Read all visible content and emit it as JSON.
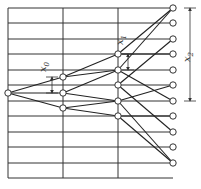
{
  "diagram": {
    "type": "tree-network",
    "colors": {
      "line": "#333333",
      "node_fill": "#ffffff",
      "background": "#ffffff"
    },
    "grid": {
      "left_x": 8,
      "right_x": 173,
      "vertical_lines_x": [
        8,
        63,
        118
      ],
      "horizontal_lines_y": [
        8,
        23,
        39,
        54,
        70,
        85,
        101,
        116,
        132,
        147,
        163,
        178
      ]
    },
    "stages": [
      {
        "name": "stage-0",
        "x": 8,
        "nodes_y": [
          93
        ]
      },
      {
        "name": "stage-1",
        "x": 63,
        "nodes_y": [
          77,
          93,
          108
        ]
      },
      {
        "name": "stage-2",
        "x": 118,
        "nodes_y": [
          54,
          70,
          85,
          101,
          116
        ]
      },
      {
        "name": "stage-3",
        "x": 173,
        "nodes_y": [
          8,
          23,
          39,
          54,
          70,
          85,
          101,
          116,
          132,
          147,
          163
        ]
      }
    ],
    "labels": {
      "x0": {
        "base": "x",
        "sub": "0"
      },
      "x1": {
        "base": "x",
        "sub": "1"
      },
      "x2": {
        "base": "x",
        "sub": "2"
      }
    },
    "dimensions": [
      {
        "label": "x0",
        "x": 52,
        "y_from": 77,
        "y_to": 93
      },
      {
        "label": "x1",
        "x": 128,
        "y_from": 54,
        "y_to": 70
      },
      {
        "label": "x2",
        "x": 190,
        "y_from": 8,
        "y_to": 101
      }
    ]
  }
}
